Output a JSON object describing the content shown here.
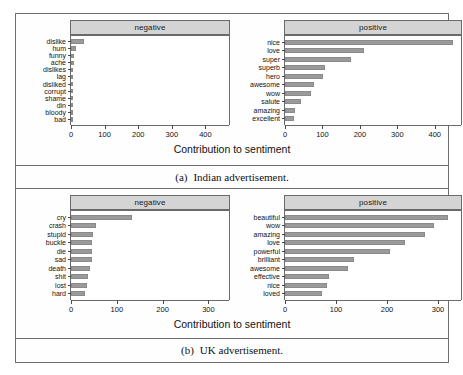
{
  "figure": {
    "axis_title": "Contribution to sentiment",
    "bar_color": "#9a9a9a",
    "strip_color": "#d4d4d4",
    "border_color": "#6a6a6a"
  },
  "subfigures": [
    {
      "caption_label": "(a)",
      "caption_text": "Indian advertisement.",
      "axis_title": "Contribution to sentiment",
      "panels": [
        {
          "strip": "negative",
          "ticks": [
            0,
            100,
            200,
            300,
            400
          ],
          "tick_labels": [
            "0",
            "100",
            "200",
            "300",
            "400"
          ],
          "xlim": [
            0,
            470
          ],
          "categories": [
            "dislike",
            "hum",
            "funny",
            "ache",
            "dislikes",
            "lag",
            "disliked",
            "corrupt",
            "shame",
            "din",
            "bloody",
            "bad"
          ],
          "values": [
            38,
            16,
            10,
            9,
            7,
            6,
            5,
            5,
            4,
            4,
            3,
            3
          ]
        },
        {
          "strip": "positive",
          "ticks": [
            0,
            100,
            200,
            300,
            400
          ],
          "tick_labels": [
            "0",
            "100",
            "200",
            "300",
            "400"
          ],
          "xlim": [
            0,
            470
          ],
          "categories": [
            "nice",
            "love",
            "super",
            "superb",
            "hero",
            "awesome",
            "wow",
            "salute",
            "amazing",
            "excellent"
          ],
          "values": [
            448,
            212,
            176,
            108,
            102,
            78,
            70,
            42,
            28,
            25
          ]
        }
      ]
    },
    {
      "caption_label": "(b)",
      "caption_text": "UK advertisement.",
      "axis_title": "Contribution to sentiment",
      "panels": [
        {
          "strip": "negative",
          "ticks": [
            0,
            100,
            200,
            300
          ],
          "tick_labels": [
            "0",
            "100",
            "200",
            "300"
          ],
          "xlim": [
            0,
            345
          ],
          "categories": [
            "cry",
            "crash",
            "stupid",
            "buckle",
            "die",
            "sad",
            "death",
            "shit",
            "lost",
            "hard"
          ],
          "values": [
            133,
            54,
            49,
            46,
            45,
            45,
            42,
            37,
            34,
            31
          ]
        },
        {
          "strip": "positive",
          "ticks": [
            0,
            100,
            200,
            300
          ],
          "tick_labels": [
            "0",
            "100",
            "200",
            "300"
          ],
          "xlim": [
            0,
            345
          ],
          "categories": [
            "beautiful",
            "wow",
            "amazing",
            "love",
            "powerful",
            "brilliant",
            "awesome",
            "effective",
            "nice",
            "loved"
          ],
          "values": [
            320,
            292,
            274,
            236,
            205,
            135,
            124,
            86,
            82,
            73
          ]
        }
      ]
    }
  ],
  "chart_data": [
    {
      "type": "bar",
      "title": "(a) Indian advertisement. — negative",
      "orientation": "horizontal",
      "xlabel": "Contribution to sentiment",
      "ylabel": "",
      "xlim": [
        0,
        470
      ],
      "grid": false,
      "legend": "none",
      "categories": [
        "dislike",
        "hum",
        "funny",
        "ache",
        "dislikes",
        "lag",
        "disliked",
        "corrupt",
        "shame",
        "din",
        "bloody",
        "bad"
      ],
      "values": [
        38,
        16,
        10,
        9,
        7,
        6,
        5,
        5,
        4,
        4,
        3,
        3
      ],
      "xticks": [
        0,
        100,
        200,
        300,
        400
      ]
    },
    {
      "type": "bar",
      "title": "(a) Indian advertisement. — positive",
      "orientation": "horizontal",
      "xlabel": "Contribution to sentiment",
      "ylabel": "",
      "xlim": [
        0,
        470
      ],
      "grid": false,
      "legend": "none",
      "categories": [
        "nice",
        "love",
        "super",
        "superb",
        "hero",
        "awesome",
        "wow",
        "salute",
        "amazing",
        "excellent"
      ],
      "values": [
        448,
        212,
        176,
        108,
        102,
        78,
        70,
        42,
        28,
        25
      ],
      "xticks": [
        0,
        100,
        200,
        300,
        400
      ]
    },
    {
      "type": "bar",
      "title": "(b) UK advertisement. — negative",
      "orientation": "horizontal",
      "xlabel": "Contribution to sentiment",
      "ylabel": "",
      "xlim": [
        0,
        345
      ],
      "grid": false,
      "legend": "none",
      "categories": [
        "cry",
        "crash",
        "stupid",
        "buckle",
        "die",
        "sad",
        "death",
        "shit",
        "lost",
        "hard"
      ],
      "values": [
        133,
        54,
        49,
        46,
        45,
        45,
        42,
        37,
        34,
        31
      ],
      "xticks": [
        0,
        100,
        200,
        300
      ]
    },
    {
      "type": "bar",
      "title": "(b) UK advertisement. — positive",
      "orientation": "horizontal",
      "xlabel": "Contribution to sentiment",
      "ylabel": "",
      "xlim": [
        0,
        345
      ],
      "grid": false,
      "legend": "none",
      "categories": [
        "beautiful",
        "wow",
        "amazing",
        "love",
        "powerful",
        "brilliant",
        "awesome",
        "effective",
        "nice",
        "loved"
      ],
      "values": [
        320,
        292,
        274,
        236,
        205,
        135,
        124,
        86,
        82,
        73
      ],
      "xticks": [
        0,
        100,
        200,
        300
      ]
    }
  ]
}
